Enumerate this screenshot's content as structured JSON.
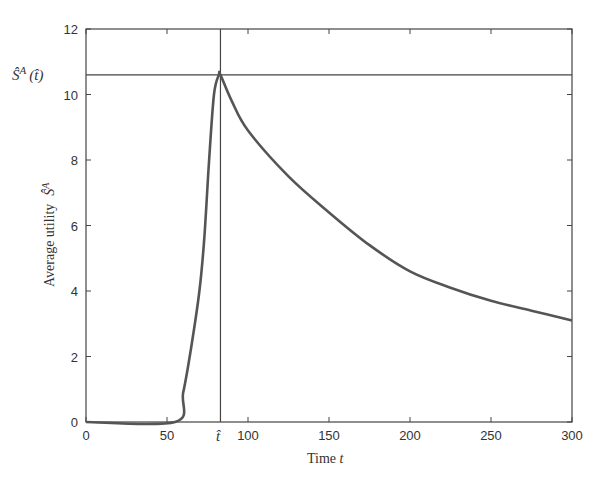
{
  "chart_data": {
    "type": "line",
    "title": "",
    "xlabel": "Time t",
    "ylabel": "Average utility Ŝ^A",
    "xlim": [
      0,
      300
    ],
    "ylim": [
      0,
      12
    ],
    "xticks": [
      0,
      50,
      100,
      150,
      200,
      250,
      300
    ],
    "yticks": [
      0,
      2,
      4,
      6,
      8,
      10,
      12
    ],
    "grid": false,
    "legend": null,
    "series": [
      {
        "name": "Ŝ^A(t)",
        "x": [
          0,
          55,
          60,
          65,
          70,
          73,
          76,
          79,
          82,
          83,
          90,
          100,
          125,
          150,
          175,
          200,
          225,
          250,
          275,
          300
        ],
        "values": [
          0,
          0,
          0.9,
          2.3,
          4.0,
          5.6,
          8.0,
          10.0,
          10.6,
          10.6,
          9.8,
          8.9,
          7.5,
          6.4,
          5.4,
          4.6,
          4.1,
          3.7,
          3.4,
          3.1
        ]
      }
    ],
    "annotations": [
      {
        "type": "vline",
        "x": 83,
        "label": "t̂"
      },
      {
        "type": "hline",
        "y": 10.6,
        "label": "Ŝ^A (t̂)"
      }
    ]
  },
  "labels": {
    "xlabel_text": "Time ",
    "xlabel_var": "t",
    "ylabel_text": "Average utility",
    "ylabel_var": "Ŝ",
    "ylabel_sup": "A",
    "hline_label_S": "Ŝ",
    "hline_label_sup": "A",
    "hline_label_arg": "(t̂)",
    "vline_label": "t̂",
    "xtick_labels": [
      "0",
      "50",
      "100",
      "150",
      "200",
      "250",
      "300"
    ],
    "ytick_labels": [
      "0",
      "2",
      "4",
      "6",
      "8",
      "10",
      "12"
    ]
  }
}
